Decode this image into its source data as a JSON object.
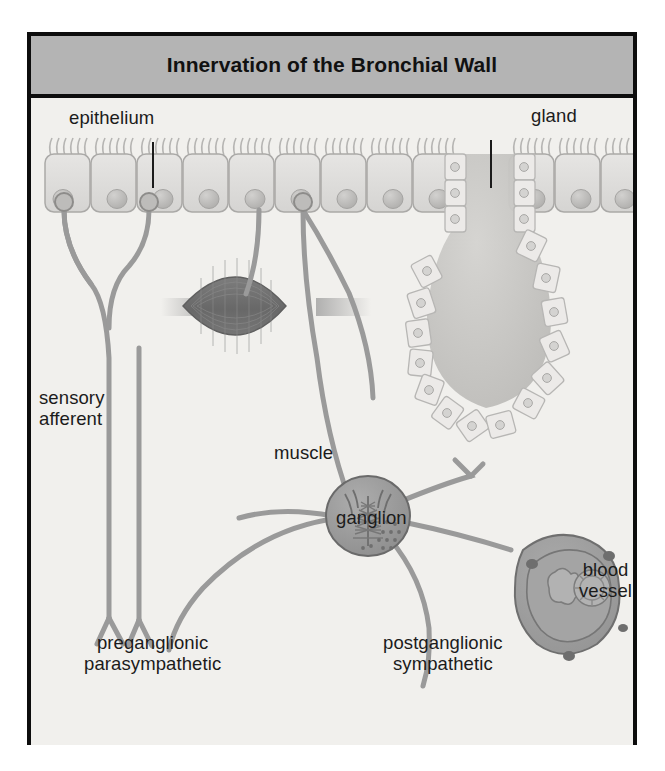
{
  "figure": {
    "title": "Innervation of the Bronchial Wall",
    "title_bar_color": "#b4b4b4",
    "frame_border_color": "#0d0d0d",
    "canvas_color": "#f1f0ed"
  },
  "labels": {
    "epithelium": "epithelium",
    "gland": "gland",
    "sensory_afferent": "sensory\nafferent",
    "muscle": "muscle",
    "ganglion": "ganglion",
    "blood_vessel": "blood\nvessel",
    "preganglionic_parasympathetic": "preganglionic\nparasympathetic",
    "postganglionic_sympathetic": "postganglionic\nsympathetic"
  },
  "structures": {
    "epithelium": {
      "name": "ciliated columnar epithelium",
      "cell_count": 14,
      "cilia_per_cell": 6,
      "fill_color": "#dedddb",
      "stroke_color": "#a9a8a6",
      "nucleus_color": "#c3c2c0"
    },
    "gland": {
      "name": "submucosal gland",
      "shape": "flask",
      "acinus_fill": "#c8c7c4",
      "lining_cell_count": 26,
      "lining_fill": "#ecebe9"
    },
    "muscle": {
      "name": "smooth muscle bundle",
      "shape": "fusiform spindle",
      "fill_color": "#6f6f6f",
      "striation_color": "#8b8b8b"
    },
    "ganglion": {
      "name": "parasympathetic ganglion",
      "fill_color": "#9a9a9a",
      "stroke_color": "#6a6a6a",
      "neuron_color": "#7b7b7b"
    },
    "blood_vessel": {
      "name": "blood vessel in cross section",
      "fill_color": "#9d9d9d",
      "stroke_color": "#6f6f6f",
      "lumen_cell_count": 2,
      "nodule_count": 4
    },
    "nerve_fibers": {
      "color": "#8e8e8e",
      "stroke_color": "#6e6e6e",
      "width_px": 5
    }
  },
  "leader_lines": {
    "epithelium_leader": "vertical line from epithelium label down to epithelial cell",
    "gland_leader": "vertical line from gland label down to gland duct"
  }
}
